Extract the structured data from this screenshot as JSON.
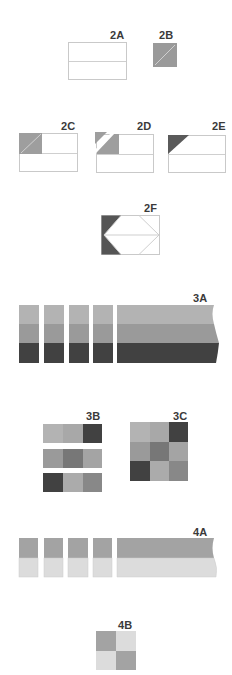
{
  "figures": {
    "f2A": {
      "label": "2A"
    },
    "f2B": {
      "label": "2B"
    },
    "f2C": {
      "label": "2C"
    },
    "f2D": {
      "label": "2D"
    },
    "f2E": {
      "label": "2E"
    },
    "f2F": {
      "label": "2F"
    },
    "f3A": {
      "label": "3A"
    },
    "f3B": {
      "label": "3B"
    },
    "f3C": {
      "label": "3C"
    },
    "f4A": {
      "label": "4A"
    },
    "f4B": {
      "label": "4B"
    }
  },
  "colors": {
    "outline": "#c9c9c9",
    "light": "#b5b5b5",
    "medium_light": "#a6a6a6",
    "medium": "#9a9a9a",
    "medium_dark": "#7a7a7a",
    "dark": "#4a4a4a",
    "darkest": "#3f3f3f",
    "pale": "#dedede",
    "label": "#3a3a3a"
  }
}
